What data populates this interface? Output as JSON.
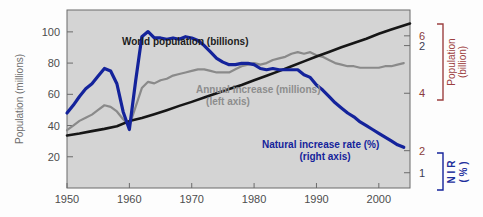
{
  "chart_data": {
    "type": "line",
    "title": "",
    "background_color": "#d4d4d4",
    "plot": {
      "x": 67,
      "y": 10,
      "width": 343,
      "height": 178
    },
    "xlabel": "",
    "xlim": [
      1950,
      2005
    ],
    "x_ticks": [
      1950,
      1960,
      1970,
      1980,
      1990,
      2000
    ],
    "x_tick_labels": [
      "1950",
      "1960",
      "1970",
      "1980",
      "1990",
      "2000"
    ],
    "grid": false,
    "legend_position": "inline-annotations",
    "axes": {
      "left": {
        "label": "Population (millions)",
        "color": "#6f6f6f",
        "ticks": [
          20,
          40,
          60,
          80,
          100
        ],
        "tick_labels": [
          "20",
          "40",
          "60",
          "80",
          "100"
        ],
        "lim": [
          0,
          114
        ]
      },
      "right_population": {
        "label_line1": "Population",
        "label_line2": "(billion)",
        "color": "#9c4040",
        "ticks": [
          2,
          4,
          6
        ],
        "tick_labels": [
          "2",
          "4",
          "6"
        ],
        "lim": [
          0.7,
          6.9
        ]
      },
      "right_nir": {
        "label_line1": "N I R",
        "label_line2": "( % )",
        "color": "#14239b",
        "ticks": [
          1,
          2
        ],
        "tick_labels": [
          "1",
          "2"
        ],
        "lim": [
          0.88,
          2.28
        ]
      }
    },
    "series": [
      {
        "name": "World population (billions)",
        "label_line1": "World population (billions)",
        "label_line2": "",
        "color": "#161616",
        "axis": "right_population",
        "x": [
          1950,
          1952,
          1954,
          1956,
          1958,
          1960,
          1962,
          1964,
          1966,
          1968,
          1970,
          1972,
          1974,
          1976,
          1978,
          1980,
          1982,
          1984,
          1986,
          1988,
          1990,
          1992,
          1994,
          1996,
          1998,
          2000,
          2002,
          2004,
          2005
        ],
        "values": [
          2.53,
          2.6,
          2.68,
          2.76,
          2.85,
          3.03,
          3.14,
          3.27,
          3.41,
          3.56,
          3.7,
          3.85,
          4.0,
          4.15,
          4.29,
          4.45,
          4.61,
          4.77,
          4.94,
          5.11,
          5.28,
          5.44,
          5.6,
          5.75,
          5.9,
          6.07,
          6.22,
          6.36,
          6.43
        ]
      },
      {
        "name": "Annual increase (millions)",
        "label_line1": "Annual increase (millions)",
        "label_line2": "(left axis)",
        "color": "#8a8a8a",
        "axis": "left",
        "x": [
          1950,
          1951,
          1952,
          1953,
          1954,
          1955,
          1956,
          1957,
          1958,
          1959,
          1960,
          1961,
          1962,
          1963,
          1964,
          1965,
          1966,
          1967,
          1968,
          1969,
          1970,
          1971,
          1972,
          1973,
          1974,
          1975,
          1976,
          1977,
          1978,
          1979,
          1980,
          1981,
          1982,
          1983,
          1984,
          1985,
          1986,
          1987,
          1988,
          1989,
          1990,
          1991,
          1992,
          1993,
          1994,
          1995,
          1996,
          1997,
          1998,
          1999,
          2000,
          2001,
          2002,
          2003,
          2004
        ],
        "values": [
          37,
          40,
          43,
          45,
          47,
          50,
          53,
          52,
          49,
          44,
          40,
          52,
          64,
          68,
          67,
          69,
          70,
          72,
          73,
          74,
          75,
          76,
          76,
          75,
          74,
          74,
          74,
          76,
          78,
          79,
          80,
          79,
          80,
          82,
          83,
          84,
          86,
          87,
          86,
          87,
          85,
          84,
          82,
          80,
          79,
          78,
          78,
          77,
          77,
          77,
          77,
          78,
          78,
          79,
          80
        ]
      },
      {
        "name": "Natural increase rate (%)",
        "label_line1": "Natural increase rate (%)",
        "label_line2": "(right axis)",
        "color": "#14239b",
        "axis": "right_nir",
        "x": [
          1950,
          1951,
          1952,
          1953,
          1954,
          1955,
          1956,
          1957,
          1958,
          1959,
          1960,
          1961,
          1962,
          1963,
          1964,
          1965,
          1966,
          1967,
          1968,
          1969,
          1970,
          1971,
          1972,
          1973,
          1974,
          1975,
          1976,
          1977,
          1978,
          1979,
          1980,
          1981,
          1982,
          1983,
          1984,
          1985,
          1986,
          1987,
          1988,
          1989,
          1990,
          1991,
          1992,
          1993,
          1994,
          1995,
          1996,
          1997,
          1998,
          1999,
          2000,
          2001,
          2002,
          2003,
          2004
        ],
        "values": [
          1.47,
          1.53,
          1.6,
          1.66,
          1.7,
          1.76,
          1.82,
          1.8,
          1.7,
          1.48,
          1.34,
          1.72,
          2.07,
          2.11,
          2.06,
          2.06,
          2.05,
          2.06,
          2.05,
          2.07,
          2.06,
          2.04,
          2.0,
          1.95,
          1.9,
          1.87,
          1.85,
          1.85,
          1.86,
          1.86,
          1.85,
          1.82,
          1.81,
          1.82,
          1.81,
          1.81,
          1.81,
          1.81,
          1.77,
          1.75,
          1.69,
          1.65,
          1.6,
          1.55,
          1.51,
          1.47,
          1.44,
          1.4,
          1.37,
          1.34,
          1.31,
          1.28,
          1.25,
          1.22,
          1.2
        ]
      }
    ],
    "annotations": [
      {
        "name": "world-population-label",
        "text": "World population (billions)",
        "x_px": 122,
        "y_px": 45
      },
      {
        "name": "annual-increase-label-line1",
        "text": "Annual increase (millions)",
        "x_px": 196,
        "y_px": 93
      },
      {
        "name": "annual-increase-label-line2",
        "text": "(left axis)",
        "x_px": 217,
        "y_px": 105
      },
      {
        "name": "natural-increase-rate-label-line1",
        "text": "Natural increase rate (%)",
        "x_px": 262,
        "y_px": 148
      },
      {
        "name": "natural-increase-rate-label-line2",
        "text": "(right axis)",
        "x_px": 285,
        "y_px": 160
      }
    ]
  }
}
